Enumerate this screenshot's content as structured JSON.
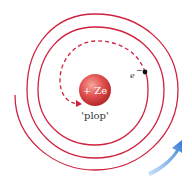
{
  "diagram": {
    "nucleus": {
      "label": "+ Ze"
    },
    "electron": {
      "label": "e",
      "superscript": "−"
    },
    "caption": "'plop'",
    "colors": {
      "spiral": "#d0223f",
      "nucleus": "#e0504e",
      "arrow": "#3a82d8",
      "electron": "#111111"
    },
    "icons": [
      "spiral-orbit",
      "dashed-final-path",
      "rotation-arrow"
    ]
  }
}
